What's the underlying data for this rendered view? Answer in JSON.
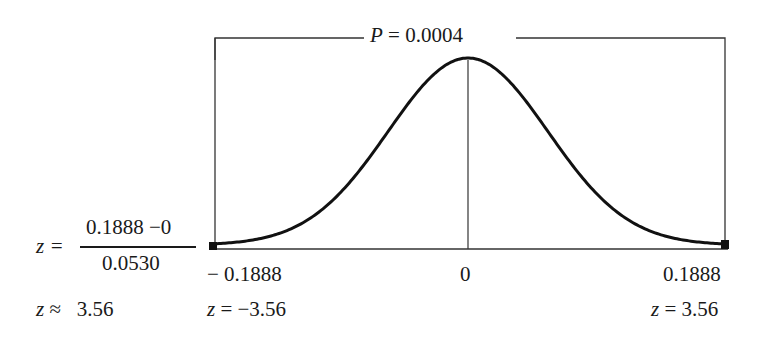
{
  "chart_data": {
    "type": "area",
    "title": "P = 0.0004",
    "distribution": "normal",
    "mean": 0,
    "standard_error": 0.053,
    "x_ticks": [
      {
        "value": -0.1888,
        "label": "− 0.1888",
        "z_label": "z = −3.56"
      },
      {
        "value": 0,
        "label": "0"
      },
      {
        "value": 0.1888,
        "label": "0.1888",
        "z_label": "z = 3.56"
      }
    ],
    "shaded_tails": [
      {
        "side": "left",
        "at": -0.1888,
        "z": -3.56
      },
      {
        "side": "right",
        "at": 0.1888,
        "z": 3.56
      }
    ],
    "p_value": 0.0004,
    "annotation": {
      "formula": "z = (0.1888 − 0) / 0.0530",
      "result": "z ≈ 3.56"
    },
    "xlabel": "",
    "ylabel": "",
    "grid": false,
    "legend": "none"
  },
  "labels": {
    "p_label_var": "P",
    "p_label_rest": " = 0.0004",
    "formula_lhs": "z =",
    "formula_num": "0.1888 −0",
    "formula_den": "0.0530",
    "approx_var": "z",
    "approx_rest": " ≈   3.56",
    "tick_left": "− 0.1888",
    "tick_center": "0",
    "tick_right": "0.1888",
    "z_left_var": "z",
    "z_left_rest": " = −3.56",
    "z_right_var": "z",
    "z_right_rest": " = 3.56"
  }
}
